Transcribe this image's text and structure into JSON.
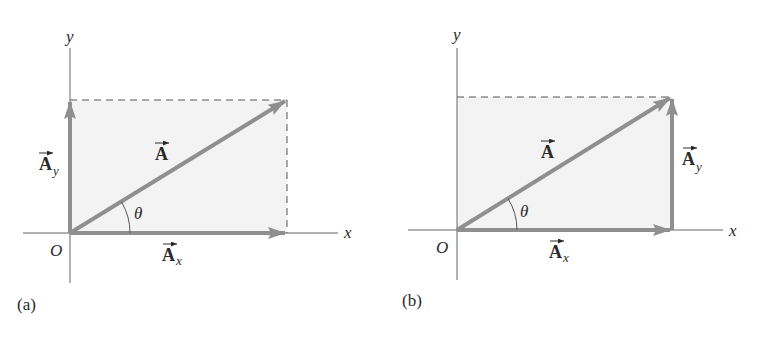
{
  "colors": {
    "axis": "#666666",
    "vector": "#8f8f8f",
    "fill": "#f3f3f3",
    "dash": "#555555",
    "text": "#2a2a2a"
  },
  "panels": [
    {
      "id": "a",
      "caption": "(a)",
      "axis_x_label": "x",
      "axis_y_label": "y",
      "origin_label": "O",
      "angle_label": "θ",
      "vector_label": "A",
      "component_x_label": "A",
      "component_x_sub": "x",
      "component_y_label": "A",
      "component_y_sub": "y",
      "component_y_position": "along y-axis"
    },
    {
      "id": "b",
      "caption": "(b)",
      "axis_x_label": "x",
      "axis_y_label": "y",
      "origin_label": "O",
      "angle_label": "θ",
      "vector_label": "A",
      "component_x_label": "A",
      "component_x_sub": "x",
      "component_y_label": "A",
      "component_y_sub": "y",
      "component_y_position": "at tip of A_x (head-to-tail)"
    }
  ]
}
